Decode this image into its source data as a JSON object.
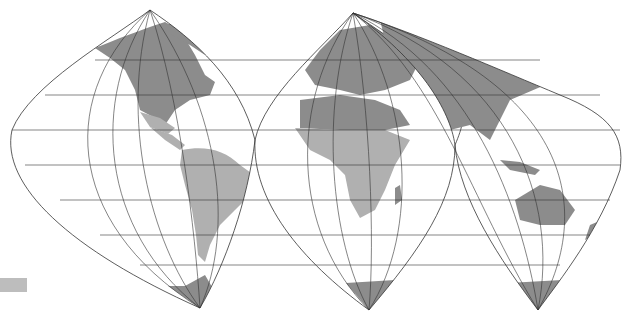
{
  "map": {
    "type": "interrupted world map projection",
    "lobes": [
      {
        "name": "americas",
        "regions": [
          "North America",
          "Central America",
          "South America",
          "Greenland",
          "Antarctica (part)"
        ]
      },
      {
        "name": "europe-africa",
        "regions": [
          "Europe",
          "Africa",
          "Middle East",
          "Madagascar",
          "Antarctica (part)"
        ]
      },
      {
        "name": "asia-oceania",
        "regions": [
          "Asia",
          "Indonesia",
          "Australia",
          "New Zealand",
          "Antarctica (part)"
        ]
      }
    ],
    "colors": {
      "background": "#ffffff",
      "land_dark": "#8c8c8c",
      "land_light": "#b0b0b0",
      "graticule": "#333333",
      "swatch": "#bdbdbd"
    }
  },
  "legend": {
    "swatch_color": "#bdbdbd"
  }
}
